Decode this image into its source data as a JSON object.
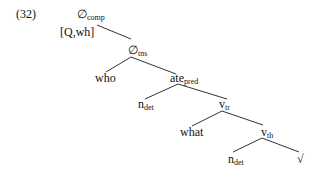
{
  "example_number": "(32)",
  "tree": {
    "root": {
      "head": "∅",
      "sub": "comp",
      "feature": "[Q,wh]"
    },
    "tns": {
      "head": "∅",
      "sub": "tns"
    },
    "specifier": {
      "text": "who"
    },
    "pred": {
      "head": "ate",
      "sub": "pred"
    },
    "n1": {
      "head": "n",
      "sub": "det"
    },
    "vtr": {
      "head": "v",
      "sub": "tr"
    },
    "object": {
      "text": "what"
    },
    "vth": {
      "head": "v",
      "sub": "th"
    },
    "n2": {
      "head": "n",
      "sub": "det"
    },
    "root_symbol": {
      "text": "√"
    }
  }
}
